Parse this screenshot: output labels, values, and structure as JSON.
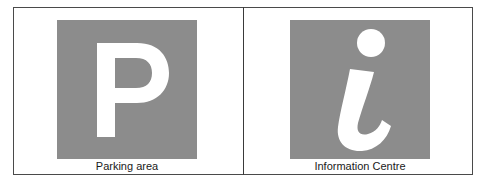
{
  "signs": [
    {
      "id": "parking",
      "symbol": "P",
      "icon": "parking-icon",
      "caption": "Parking area",
      "background": "#8c8c8c",
      "foreground": "#ffffff"
    },
    {
      "id": "information",
      "symbol": "i",
      "icon": "information-icon",
      "caption": "Information Centre",
      "background": "#8c8c8c",
      "foreground": "#ffffff"
    }
  ],
  "colors": {
    "border": "#4a4a4a",
    "text": "#1a1a1a",
    "page": "#ffffff"
  }
}
